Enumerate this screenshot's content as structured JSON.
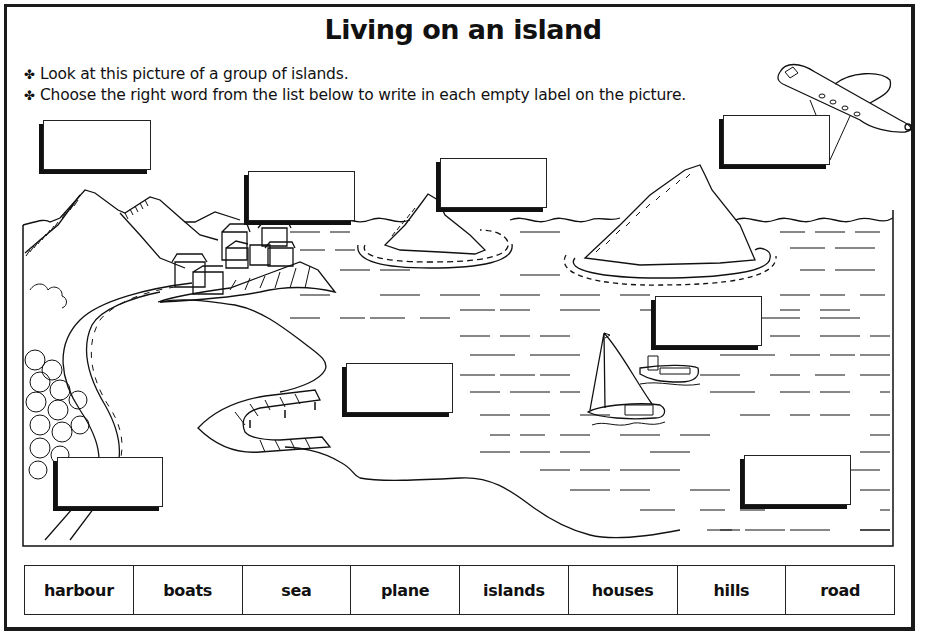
{
  "worksheet": {
    "title": "Living on an island",
    "instructions": [
      {
        "bullet": "✤",
        "text": "Look at this picture of a group of islands."
      },
      {
        "bullet": "✤",
        "text": "Choose the right word from the list below to write in each empty label on the picture."
      }
    ],
    "picture": {
      "description": "Line drawing of a group of islands with hills, houses, road, trees, harbour jetty, boats on the sea and a plane in the sky",
      "label_boxes": [
        {
          "id": "box-top-left",
          "value": ""
        },
        {
          "id": "box-houses",
          "value": ""
        },
        {
          "id": "box-island-mid",
          "value": ""
        },
        {
          "id": "box-plane",
          "value": ""
        },
        {
          "id": "box-sea-right",
          "value": ""
        },
        {
          "id": "box-harbour",
          "value": ""
        },
        {
          "id": "box-road",
          "value": ""
        },
        {
          "id": "box-bottom-right",
          "value": ""
        }
      ]
    },
    "word_bank": [
      "harbour",
      "boats",
      "sea",
      "plane",
      "islands",
      "houses",
      "hills",
      "road"
    ]
  },
  "colors": {
    "ink": "#111111",
    "paper": "#ffffff"
  }
}
